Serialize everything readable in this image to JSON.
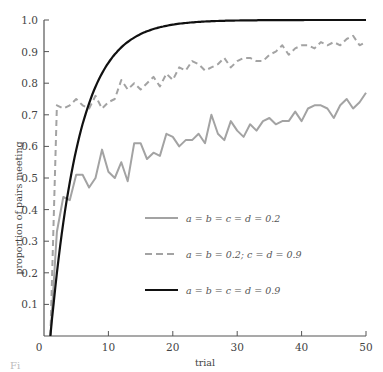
{
  "chart_data": {
    "type": "line",
    "title": "",
    "xlabel": "trial",
    "ylabel": "proportion of pairs meeting",
    "xlim": [
      0,
      50
    ],
    "ylim": [
      0,
      1.0
    ],
    "xticks": [
      0,
      10,
      20,
      30,
      40,
      50
    ],
    "xtick_labels": [
      "0",
      "10",
      "20",
      "30",
      "40",
      "50"
    ],
    "yticks": [
      0.1,
      0.2,
      0.3,
      0.4,
      0.5,
      0.6,
      0.7,
      0.8,
      0.9,
      1.0
    ],
    "ytick_labels": [
      "0.1",
      "0.2",
      "0.3",
      "0.4",
      "0.5",
      "0.6",
      "0.7",
      "0.8",
      "0.9",
      "1.0"
    ],
    "grid": false,
    "legend_position": "center",
    "x": [
      1,
      2,
      3,
      4,
      5,
      6,
      7,
      8,
      9,
      10,
      11,
      12,
      13,
      14,
      15,
      16,
      17,
      18,
      19,
      20,
      21,
      22,
      23,
      24,
      25,
      26,
      27,
      28,
      29,
      30,
      31,
      32,
      33,
      34,
      35,
      36,
      37,
      38,
      39,
      40,
      41,
      42,
      43,
      44,
      45,
      46,
      47,
      48,
      49,
      50
    ],
    "series": [
      {
        "name": "a = b = c = d = 0.2",
        "style": "solid-gray",
        "color": "#a0a0a0",
        "values": [
          0.0,
          0.33,
          0.44,
          0.43,
          0.51,
          0.51,
          0.47,
          0.5,
          0.59,
          0.52,
          0.5,
          0.55,
          0.49,
          0.61,
          0.61,
          0.56,
          0.58,
          0.57,
          0.64,
          0.63,
          0.6,
          0.62,
          0.62,
          0.64,
          0.61,
          0.7,
          0.64,
          0.62,
          0.68,
          0.65,
          0.63,
          0.67,
          0.65,
          0.68,
          0.69,
          0.67,
          0.68,
          0.68,
          0.71,
          0.68,
          0.72,
          0.73,
          0.73,
          0.72,
          0.69,
          0.73,
          0.75,
          0.72,
          0.74,
          0.77
        ]
      },
      {
        "name": "a = b = 0.2; c = d = 0.9",
        "style": "dashed-gray",
        "color": "#a0a0a0",
        "values": [
          0.0,
          0.73,
          0.72,
          0.73,
          0.75,
          0.73,
          0.72,
          0.76,
          0.72,
          0.74,
          0.75,
          0.81,
          0.78,
          0.8,
          0.78,
          0.8,
          0.82,
          0.79,
          0.83,
          0.81,
          0.85,
          0.84,
          0.87,
          0.86,
          0.84,
          0.85,
          0.86,
          0.88,
          0.85,
          0.87,
          0.88,
          0.88,
          0.87,
          0.87,
          0.89,
          0.9,
          0.92,
          0.89,
          0.91,
          0.92,
          0.92,
          0.91,
          0.93,
          0.92,
          0.93,
          0.92,
          0.94,
          0.95,
          0.92,
          0.93
        ]
      },
      {
        "name": "a = b = c = d = 0.9",
        "style": "solid-black",
        "color": "#111111",
        "values": [
          0.0,
          0.19,
          0.35,
          0.47,
          0.57,
          0.65,
          0.71,
          0.76,
          0.8,
          0.84,
          0.87,
          0.89,
          0.91,
          0.925,
          0.94,
          0.95,
          0.96,
          0.967,
          0.973,
          0.978,
          0.982,
          0.985,
          0.988,
          0.99,
          0.992,
          0.993,
          0.995,
          0.996,
          0.997,
          0.997,
          0.998,
          0.998,
          0.999,
          0.999,
          0.999,
          1.0,
          1.0,
          1.0,
          1.0,
          1.0,
          1.0,
          1.0,
          1.0,
          1.0,
          1.0,
          1.0,
          1.0,
          1.0,
          1.0,
          1.0
        ]
      }
    ]
  },
  "caption": "Fi"
}
